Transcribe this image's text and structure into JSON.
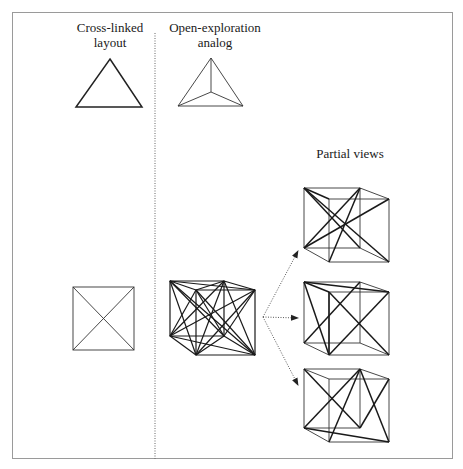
{
  "columns": {
    "left": {
      "title_line1": "Cross-linked",
      "title_line2": "layout"
    },
    "middle": {
      "title_line1": "Open-exploration",
      "title_line2": "analog"
    },
    "right": {
      "title": "Partial views"
    }
  },
  "figures": {
    "left_triangle": "triangle",
    "middle_triangle": "tetrahedron-top-view",
    "left_square": "square-with-diagonals",
    "middle_cube": "fully-connected-cube",
    "partial_views": [
      "partial-cube-view-1",
      "partial-cube-view-2",
      "partial-cube-view-3"
    ]
  },
  "colors": {
    "stroke": "#222222",
    "frame": "#9a9a9a",
    "divider": "#666666"
  }
}
